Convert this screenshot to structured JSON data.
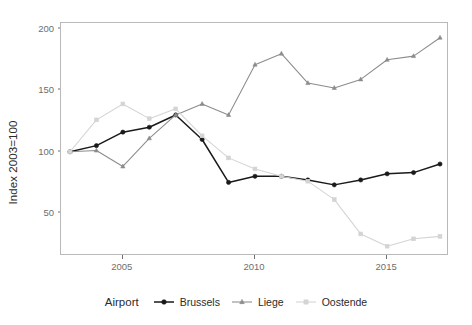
{
  "chart_data": {
    "type": "line",
    "title": "",
    "xlabel": "",
    "ylabel": "Index 2003=100",
    "xlim": [
      2003,
      2017
    ],
    "ylim": [
      15,
      205
    ],
    "grid": false,
    "legend_position": "bottom",
    "legend_title": "Airport",
    "x": [
      2003,
      2004,
      2005,
      2006,
      2007,
      2008,
      2009,
      2010,
      2011,
      2012,
      2013,
      2014,
      2015,
      2016,
      2017
    ],
    "xticks": [
      2005,
      2010,
      2015
    ],
    "yticks": [
      50,
      100,
      150,
      200
    ],
    "series": [
      {
        "name": "Brussels",
        "color": "#1a1a1a",
        "marker": "circle",
        "values": [
          100,
          105,
          116,
          120,
          130,
          110,
          75,
          80,
          80,
          77,
          73,
          77,
          82,
          83,
          90
        ]
      },
      {
        "name": "Liege",
        "color": "#8c8c8c",
        "marker": "triangle",
        "values": [
          100,
          101,
          88,
          111,
          130,
          139,
          130,
          171,
          180,
          156,
          152,
          159,
          175,
          178,
          193
        ]
      },
      {
        "name": "Oostende",
        "color": "#d4d4d4",
        "marker": "square",
        "values": [
          100,
          126,
          139,
          127,
          135,
          113,
          95,
          86,
          80,
          76,
          61,
          33,
          23,
          29,
          31
        ]
      }
    ]
  },
  "axis": {
    "y_title": "Index 2003=100",
    "y_tick_labels": [
      "50",
      "100",
      "150",
      "200"
    ],
    "x_tick_labels": [
      "2005",
      "2010",
      "2015"
    ]
  },
  "legend": {
    "title": "Airport",
    "items": [
      {
        "label": "Brussels",
        "color": "#1a1a1a",
        "marker": "circle"
      },
      {
        "label": "Liege",
        "color": "#8c8c8c",
        "marker": "triangle"
      },
      {
        "label": "Oostende",
        "color": "#d4d4d4",
        "marker": "square"
      }
    ]
  }
}
